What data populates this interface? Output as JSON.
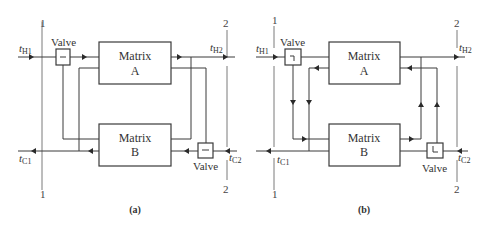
{
  "figure": {
    "panels": [
      {
        "caption": "(a)",
        "matrix_top": {
          "line1": "Matrix",
          "line2": "A"
        },
        "matrix_bottom": {
          "line1": "Matrix",
          "line2": "B"
        },
        "valve_top_label": "Valve",
        "valve_bottom_label": "Valve",
        "valve_top_symbol": "−",
        "valve_bottom_symbol": "−",
        "section_left_top": "1",
        "section_left_bottom": "1",
        "section_right_top": "2",
        "section_right_bottom": "2",
        "t_h1": {
          "base": "t",
          "sub": "H1"
        },
        "t_h2": {
          "base": "t",
          "sub": "H2"
        },
        "t_c1": {
          "base": "t",
          "sub": "C1"
        },
        "t_c2": {
          "base": "t",
          "sub": "C2"
        }
      },
      {
        "caption": "(b)",
        "matrix_top": {
          "line1": "Matrix",
          "line2": "A"
        },
        "matrix_bottom": {
          "line1": "Matrix",
          "line2": "B"
        },
        "valve_top_label": "Valve",
        "valve_bottom_label": "Valve",
        "valve_top_symbol": "┐",
        "valve_bottom_symbol": "└",
        "section_left_top": "1",
        "section_left_bottom": "1",
        "section_right_top": "2",
        "section_right_bottom": "2",
        "t_h1": {
          "base": "t",
          "sub": "H1"
        },
        "t_h2": {
          "base": "t",
          "sub": "H2"
        },
        "t_c1": {
          "base": "t",
          "sub": "C1"
        },
        "t_c2": {
          "base": "t",
          "sub": "C2"
        }
      }
    ],
    "colors": {
      "line": "#3a3a3a",
      "section_line": "#7a7a7a",
      "background": "#ffffff"
    }
  }
}
